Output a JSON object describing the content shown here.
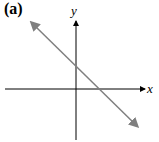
{
  "panel_label": "(a)",
  "axes": {
    "x_label": "x",
    "y_label": "y"
  },
  "line": {
    "description": "straight line with negative slope, positive y-intercept and positive x-intercept, arrows at both ends",
    "color": "#7f7f7f"
  },
  "axis_color": "#000000"
}
